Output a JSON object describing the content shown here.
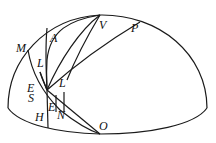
{
  "diagram": {
    "type": "celestial-hemisphere",
    "stroke_color": "#1a1a1a",
    "background": "#ffffff",
    "labels": [
      {
        "id": "M",
        "text": "M",
        "x": 16,
        "y": 42
      },
      {
        "id": "A",
        "text": "A",
        "x": 50,
        "y": 32
      },
      {
        "id": "V",
        "text": "V",
        "x": 99,
        "y": 19
      },
      {
        "id": "P",
        "text": "P",
        "x": 131,
        "y": 22
      },
      {
        "id": "L1",
        "text": "L",
        "x": 37,
        "y": 57
      },
      {
        "id": "L2",
        "text": "L",
        "x": 59,
        "y": 77
      },
      {
        "id": "E1",
        "text": "E",
        "x": 27,
        "y": 82
      },
      {
        "id": "S",
        "text": "S",
        "x": 28,
        "y": 92
      },
      {
        "id": "E2",
        "text": "E",
        "x": 48,
        "y": 101
      },
      {
        "id": "N",
        "text": "N",
        "x": 57,
        "y": 109
      },
      {
        "id": "H",
        "text": "H",
        "x": 35,
        "y": 111
      },
      {
        "id": "O",
        "text": "O",
        "x": 99,
        "y": 120
      }
    ]
  }
}
